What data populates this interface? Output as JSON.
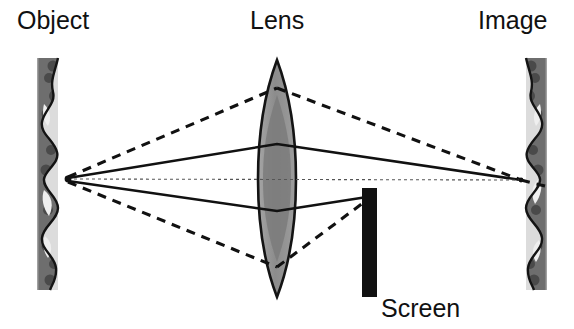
{
  "figure": {
    "width": 574,
    "height": 329,
    "background_color": "#ffffff"
  },
  "labels": {
    "object": "Object",
    "lens": "Lens",
    "image": "Image",
    "screen": "Screen"
  },
  "colors": {
    "text": "#111111",
    "outline": "#141414",
    "object_fill": "#6e6e6e",
    "object_highlight": "#e3e3e3",
    "lens_fill": "#8f8f8f",
    "lens_core_fill": "#757575",
    "screen_fill": "#111111",
    "ray_solid": "#111111",
    "ray_dashed": "#111111",
    "axis": "#555555"
  },
  "geometry": {
    "object_plane": {
      "x_left": 38,
      "x_right": 58,
      "y_top": 58,
      "y_bottom": 290
    },
    "lens": {
      "center_x": 277,
      "half_width": 19,
      "y_top": 60,
      "y_bottom": 297
    },
    "screen": {
      "x_left": 362,
      "x_right": 377,
      "y_top": 188,
      "y_bottom": 297
    },
    "image_plane": {
      "x_left": 522,
      "x_right": 546,
      "y_top": 58,
      "y_bottom": 290
    },
    "source_point": {
      "x": 68,
      "y": 178
    },
    "focus_point": {
      "x": 521,
      "y": 180
    },
    "optical_axis_y": 179
  },
  "rays": {
    "solid": [
      {
        "name": "upper-marginal-ray",
        "points": "68,178 277,144 521,180"
      },
      {
        "name": "lower-marginal-ray",
        "points": "68,181 277,211 521,180"
      },
      {
        "name": "optical-axis-ray",
        "points": "68,179 277,179 521,180"
      }
    ],
    "dashed": [
      {
        "name": "upper-divergent-ray",
        "points": "68,177 277,88 521,180"
      },
      {
        "name": "lower-divergent-ray",
        "points": "68,182 277,267 521,180"
      },
      {
        "name": "upper-screen-ray",
        "points": "277,88 366,198"
      },
      {
        "name": "lower-screen-ray",
        "points": "277,267 366,202"
      },
      {
        "name": "upper-overshoot-ray",
        "points": "521,180 545,186"
      },
      {
        "name": "lower-overshoot-ray",
        "points": "366,198 521,180"
      }
    ]
  },
  "annotations": {
    "object_edge_profile": "scalloped-wavy-right-edge",
    "image_edge_profile": "scalloped-wavy-left-edge",
    "ray_style_solid": "converging-image-forming-rays",
    "ray_style_dashed": "wide-aperture-rays-blocked-by-screen"
  }
}
